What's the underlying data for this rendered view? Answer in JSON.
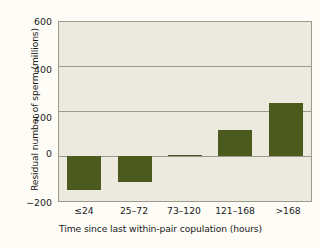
{
  "chart_data": {
    "type": "bar",
    "title": "",
    "categories": [
      "≤24",
      "25–72",
      "73–120",
      "121–168",
      ">168"
    ],
    "values": [
      -150,
      -113,
      5,
      117,
      237
    ],
    "series": [
      {
        "name": "Residual number of sperm",
        "values": [
          -150,
          -113,
          5,
          117,
          237
        ]
      }
    ],
    "xlabel": "Time since last within-pair copulation (hours)",
    "ylabel": "Residual number of sperm (millions)",
    "ylim": [
      -200,
      600
    ],
    "yticks": [
      600,
      400,
      200,
      0,
      -200
    ],
    "ytick_labels": [
      "600",
      "400",
      "200",
      "0",
      "−200"
    ],
    "grid": true,
    "legend": "none",
    "bar_color": "#4d5a1e",
    "plot_background": "#eceade",
    "grid_color": "#9a9a8e",
    "page_background": "#fdfcf7"
  }
}
